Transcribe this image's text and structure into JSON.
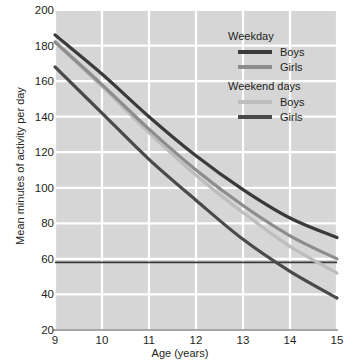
{
  "chart_data": {
    "type": "line",
    "title": "",
    "xlabel": "Age (years)",
    "ylabel": "Mean minutes of activity per day",
    "xlim": [
      9,
      15
    ],
    "ylim": [
      20,
      200
    ],
    "xticks": [
      9,
      10,
      11,
      12,
      13,
      14,
      15
    ],
    "yticks": [
      20,
      40,
      60,
      80,
      100,
      120,
      140,
      160,
      180,
      200
    ],
    "grid": true,
    "legend_position": "top-right",
    "x": [
      9,
      10,
      11,
      12,
      13,
      14,
      15
    ],
    "series": [
      {
        "name": "Weekday Boys",
        "group": "Weekday",
        "label": "Boys",
        "color": "#3a3a3a",
        "values": [
          186,
          164,
          140,
          118,
          99,
          83,
          72
        ]
      },
      {
        "name": "Weekday Girls",
        "group": "Weekday",
        "label": "Girls",
        "color": "#8d8d8d",
        "values": [
          182,
          158,
          133,
          110,
          90,
          73,
          60
        ]
      },
      {
        "name": "Weekend days Boys",
        "group": "Weekend days",
        "label": "Boys",
        "color": "#bdbdbd",
        "values": [
          182,
          157,
          131,
          107,
          86,
          67,
          52
        ]
      },
      {
        "name": "Weekend days Girls",
        "group": "Weekend days",
        "label": "Girls",
        "color": "#4a4a4a",
        "values": [
          168,
          142,
          116,
          93,
          71,
          53,
          38
        ]
      }
    ],
    "reference_lines": [
      {
        "name": "recommended-activity-line",
        "orientation": "horizontal",
        "value": 58,
        "color": "#3a3a3a"
      }
    ],
    "colors": {
      "plot_background": "#d6d6d6",
      "gridline": "#ffffff",
      "page_background": "#ffffff",
      "text": "#231f20"
    }
  },
  "legend": {
    "groups": [
      {
        "heading": "Weekday",
        "entries": [
          {
            "label": "Boys",
            "color": "#3a3a3a"
          },
          {
            "label": "Girls",
            "color": "#8d8d8d"
          }
        ]
      },
      {
        "heading": "Weekend days",
        "entries": [
          {
            "label": "Boys",
            "color": "#bdbdbd"
          },
          {
            "label": "Girls",
            "color": "#4a4a4a"
          }
        ]
      }
    ]
  },
  "axes": {
    "y_title": "Mean minutes of activity per day",
    "x_title": "Age (years)",
    "y_tick_labels": [
      "200",
      "180",
      "160",
      "140",
      "120",
      "100",
      "80",
      "60",
      "40",
      "20"
    ],
    "x_tick_labels": [
      "9",
      "10",
      "11",
      "12",
      "13",
      "14",
      "15"
    ]
  }
}
